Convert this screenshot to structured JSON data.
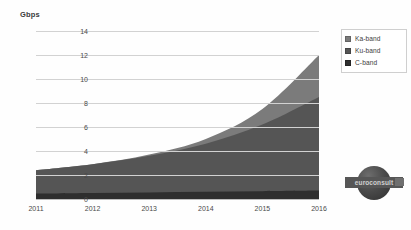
{
  "chart_data": {
    "type": "area",
    "stacked": true,
    "title": "",
    "subtitle": "",
    "xlabel": "",
    "ylabel": "Gbps",
    "categories": [
      "2011",
      "2012",
      "2013",
      "2014",
      "2015",
      "2016"
    ],
    "x": [
      2011,
      2012,
      2013,
      2014,
      2015,
      2016
    ],
    "ylim": [
      0,
      14
    ],
    "ytick_labels": [
      "0",
      "2",
      "4",
      "6",
      "8",
      "10",
      "12",
      "14"
    ],
    "ytick_values": [
      0,
      2,
      4,
      6,
      8,
      10,
      12,
      14
    ],
    "grid": true,
    "legend_position": "right",
    "series": [
      {
        "name": "C-band",
        "color": "#2e2e2e",
        "values": [
          0.45,
          0.5,
          0.55,
          0.6,
          0.65,
          0.7
        ]
      },
      {
        "name": "Ku-band",
        "color": "#555555",
        "values": [
          1.95,
          2.4,
          3.05,
          4.0,
          5.55,
          7.8
        ]
      },
      {
        "name": "Ka-band",
        "color": "#7b7b7b",
        "values": [
          0.0,
          0.0,
          0.1,
          0.4,
          1.3,
          3.5
        ]
      }
    ],
    "stack_totals": [
      2.4,
      2.9,
      3.7,
      5.0,
      7.5,
      12.0
    ],
    "annotations": []
  },
  "axis": {
    "y_unit_label": "Gbps"
  },
  "legend": {
    "items": [
      {
        "label": "Ka-band",
        "color": "#7b7b7b"
      },
      {
        "label": "Ku-band",
        "color": "#555555"
      },
      {
        "label": "C-band",
        "color": "#2e2e2e"
      }
    ]
  },
  "watermark": {
    "text": "euroconsult"
  }
}
